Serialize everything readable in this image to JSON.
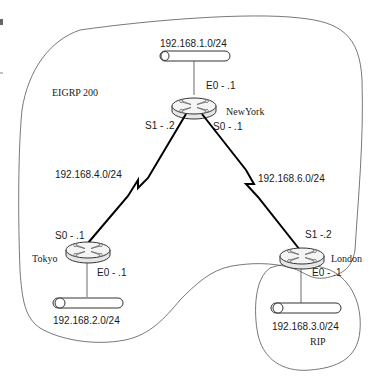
{
  "diagram": {
    "domains": [
      {
        "id": "eigrp",
        "label": "EIGRP 200"
      },
      {
        "id": "rip",
        "label": "RIP"
      }
    ],
    "routers": [
      {
        "id": "newyork",
        "name": "NewYork",
        "interfaces": {
          "e0": "E0 - .1",
          "s1": "S1 - .2",
          "s0": "S0 - .1"
        }
      },
      {
        "id": "tokyo",
        "name": "Tokyo",
        "interfaces": {
          "s0": "S0 - .1",
          "e0": "E0 - .1"
        }
      },
      {
        "id": "london",
        "name": "London",
        "interfaces": {
          "s1": "S1 -.2",
          "e0": "E0 - .1"
        }
      }
    ],
    "lans": [
      {
        "id": "ny-lan",
        "network": "192.168.1.0/24",
        "router": "newyork"
      },
      {
        "id": "tokyo-lan",
        "network": "192.168.2.0/24",
        "router": "tokyo"
      },
      {
        "id": "london-lan",
        "network": "192.168.3.0/24",
        "router": "london"
      }
    ],
    "serial_links": [
      {
        "id": "ny-tokyo",
        "network": "192.168.4.0/24",
        "from": "newyork",
        "to": "tokyo"
      },
      {
        "id": "ny-london",
        "network": "192.168.6.0/24",
        "from": "newyork",
        "to": "london"
      }
    ]
  }
}
